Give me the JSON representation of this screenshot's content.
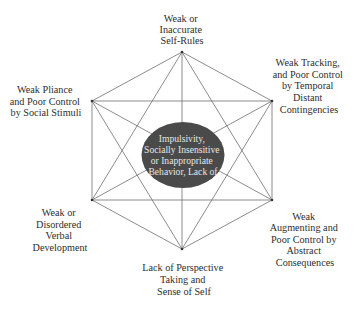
{
  "diagram": {
    "type": "hexagonal network diagram (complete graph of six nodes around a central node)",
    "center": {
      "lines": [
        "Impulsivity,",
        "Socially Insensitive",
        "or Inappropriate",
        "Behavior, Lack of"
      ],
      "fill_color": "#4a4a4a",
      "text_color": "#e6e6e6"
    },
    "nodes": [
      {
        "id": "top",
        "lines": [
          "Weak or",
          "Inaccurate",
          "Self-Rules"
        ]
      },
      {
        "id": "upper-right",
        "lines": [
          "Weak Tracking,",
          "and Poor Control",
          "by Temporal",
          "Distant",
          "Contingencies"
        ]
      },
      {
        "id": "lower-right",
        "lines": [
          "Weak",
          "Augmenting and",
          "Poor Control by",
          "Abstract",
          "Consequences"
        ]
      },
      {
        "id": "bottom",
        "lines": [
          "Lack of Perspective",
          "Taking and",
          "Sense of Self"
        ]
      },
      {
        "id": "lower-left",
        "lines": [
          "Weak or",
          "Disordered",
          "Verbal",
          "Development"
        ]
      },
      {
        "id": "upper-left",
        "lines": [
          "Weak Pliance",
          "and Poor Control",
          "by Social Stimuli"
        ]
      }
    ],
    "colors": {
      "edge": "#6f6f6f",
      "text": "#2e2e2e",
      "background": "#ffffff"
    }
  }
}
